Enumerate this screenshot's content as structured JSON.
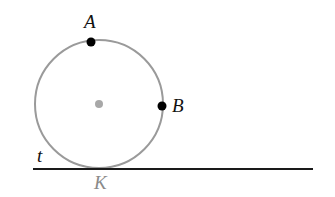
{
  "diagram": {
    "type": "circle-tangent-line",
    "colors": {
      "circle": "#9a9a9a",
      "center": "#a8a8a8",
      "points": "#000000",
      "line": "#1a1a1a",
      "label_dark": "#111111",
      "label_gray": "#8a8a8a"
    },
    "circle": {
      "cx": 99,
      "cy": 104,
      "r": 64
    },
    "center_point": {
      "x": 99,
      "y": 104
    },
    "points": [
      {
        "name": "A",
        "x": 91,
        "y": 42,
        "label": "A",
        "label_x": 84,
        "label_y": 28
      },
      {
        "name": "B",
        "x": 162,
        "y": 106,
        "label": "B",
        "label_x": 172,
        "label_y": 112
      }
    ],
    "tangent_line": {
      "name": "t",
      "x1": 33,
      "y1": 169,
      "x2": 313,
      "y2": 169,
      "label": "t",
      "label_x": 37,
      "label_y": 162
    },
    "tangent_point": {
      "name": "K",
      "label": "K",
      "label_x": 94,
      "label_y": 189
    }
  }
}
